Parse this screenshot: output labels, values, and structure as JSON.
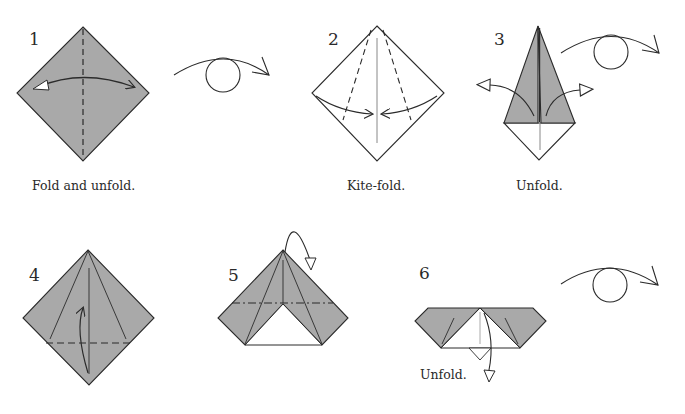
{
  "colors": {
    "paper_colored": "#a9a9a9",
    "paper_white": "#ffffff",
    "line": "#2b2b2b"
  },
  "steps": [
    {
      "number": "1",
      "caption": "Fold and unfold.",
      "symbols": [
        "valley-fold-line",
        "fold-and-unfold-arrow",
        "turn-over-symbol"
      ]
    },
    {
      "number": "2",
      "caption": "Kite-fold.",
      "symbols": [
        "valley-fold-lines",
        "fold-arrows"
      ]
    },
    {
      "number": "3",
      "caption": "Unfold.",
      "symbols": [
        "unfold-arrows",
        "turn-over-symbol"
      ]
    },
    {
      "number": "4",
      "caption": "",
      "symbols": [
        "valley-fold-line",
        "fold-up-arrow"
      ]
    },
    {
      "number": "5",
      "caption": "",
      "symbols": [
        "mountain-fold-line",
        "fold-behind-arrow"
      ]
    },
    {
      "number": "6",
      "caption": "Unfold.",
      "symbols": [
        "unfold-arrow",
        "turn-over-symbol"
      ]
    }
  ]
}
